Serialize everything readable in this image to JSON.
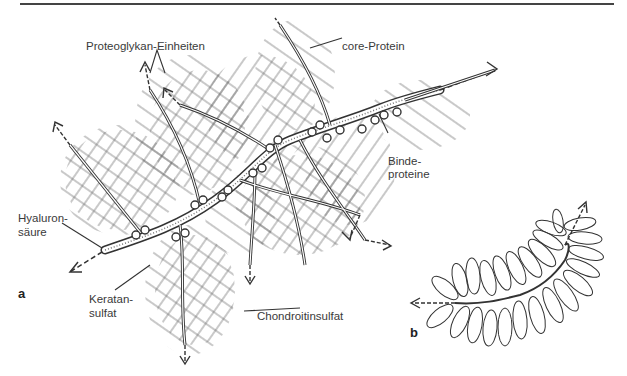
{
  "figure": {
    "panel_a_label": "a",
    "panel_b_label": "b",
    "labels": {
      "proteoglykan": "Proteoglykan-Einheiten",
      "core_protein": "core-Protein",
      "binde_line1": "Binde-",
      "binde_line2": "proteine",
      "hyaluron_line1": "Hyaluron-",
      "hyaluron_line2": "säure",
      "keratan_line1": "Keratan-",
      "keratan_line2": "sulfat",
      "chondroitin": "Chondroitinsulfat"
    },
    "colors": {
      "ink": "#333333",
      "background": "#ffffff"
    }
  }
}
